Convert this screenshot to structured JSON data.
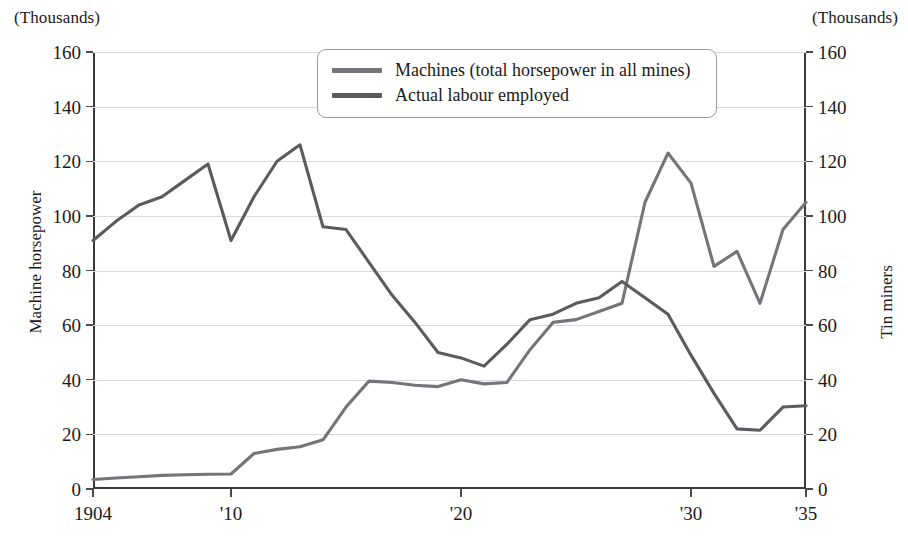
{
  "units": {
    "left": "(Thousands)",
    "right": "(Thousands)"
  },
  "axis_titles": {
    "left": "Machine horsepower",
    "right": "Tin miners"
  },
  "legend": {
    "items": [
      {
        "label": "Machines (total horsepower in all mines)",
        "color": "#74747a"
      },
      {
        "label": "Actual labour employed",
        "color": "#5a5a60"
      }
    ]
  },
  "chart_data": {
    "type": "line",
    "title": "",
    "xlabel": "",
    "ylabel": "Machine horsepower",
    "y2label": "Tin miners",
    "xlim": [
      1904,
      1935
    ],
    "ylim": [
      0,
      160
    ],
    "y2lim": [
      0,
      160
    ],
    "grid": true,
    "legend_position": "top-center",
    "yticks": [
      0,
      20,
      40,
      60,
      80,
      100,
      120,
      140,
      160
    ],
    "y2ticks": [
      0,
      20,
      40,
      60,
      80,
      100,
      120,
      140,
      160
    ],
    "xticks": [
      1904,
      1910,
      1920,
      1930,
      1935
    ],
    "xticklabels": [
      "1904",
      "'10",
      "'20",
      "'30",
      "'35"
    ],
    "x": [
      1904,
      1905,
      1906,
      1907,
      1908,
      1909,
      1910,
      1911,
      1912,
      1913,
      1914,
      1915,
      1916,
      1917,
      1918,
      1919,
      1920,
      1921,
      1922,
      1923,
      1924,
      1925,
      1926,
      1927,
      1928,
      1929,
      1930,
      1931,
      1932,
      1933,
      1934,
      1935
    ],
    "series": [
      {
        "name": "Machines (total horsepower in all mines)",
        "axis": "left",
        "color": "#74747a",
        "values": [
          3.5,
          4.0,
          4.5,
          5.0,
          5.2,
          5.4,
          5.5,
          13.0,
          14.5,
          15.5,
          18.0,
          30.0,
          39.5,
          39.0,
          38.0,
          37.5,
          40.0,
          38.5,
          39.0,
          51.0,
          61.0,
          62.0,
          65.0,
          68.0,
          105.0,
          123.0,
          112.0,
          81.5,
          87.0,
          68.0,
          95.0,
          105.0
        ]
      },
      {
        "name": "Actual labour employed",
        "axis": "right",
        "color": "#5a5a60",
        "values": [
          91.0,
          98.0,
          104.0,
          107.0,
          113.0,
          119.0,
          91.0,
          107.0,
          120.0,
          126.0,
          96.0,
          95.0,
          83.0,
          71.0,
          61.0,
          50.0,
          48.0,
          45.0,
          53.0,
          62.0,
          64.0,
          68.0,
          70.0,
          76.0,
          70.0,
          64.0,
          49.0,
          35.0,
          22.0,
          21.5,
          30.0,
          30.5
        ]
      }
    ]
  }
}
